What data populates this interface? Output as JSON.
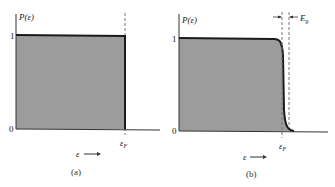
{
  "figure": {
    "panels": [
      {
        "id": "a",
        "caption": "(a)",
        "y_axis_label": "P(ε)",
        "y_ticks": [
          "0",
          "1"
        ],
        "x_axis_label": "ε",
        "x_marker_label": "εF",
        "description": "Step function occupation probability at T = 0"
      },
      {
        "id": "b",
        "caption": "(b)",
        "y_axis_label": "P(ε)",
        "y_ticks": [
          "0",
          "1"
        ],
        "x_axis_label": "ε",
        "x_marker_label": "εF",
        "width_label": "Eg",
        "description": "Fermi-Dirac occupation probability at T > 0 with smeared edge of width Eg"
      }
    ],
    "colors": {
      "fill": "#9c9c9c",
      "line": "#1a1a1a",
      "dashed": "#777777"
    }
  }
}
